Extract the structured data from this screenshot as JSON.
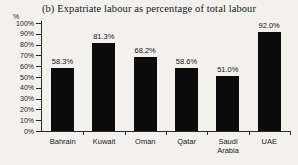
{
  "chart_data": {
    "type": "bar",
    "title": "(b) Expatriate labour as percentage of total labour",
    "xlabel": "",
    "ylabel": "%",
    "categories": [
      "Bahrain",
      "Kuwait",
      "Oman",
      "Qatar",
      "Saudi Arabia",
      "UAE"
    ],
    "values": [
      58.3,
      81.3,
      68.2,
      58.6,
      51.0,
      92.0
    ],
    "data_labels": [
      "58.3%",
      "81.3%",
      "68.2%",
      "58.6%",
      "51.0%",
      "92.0%"
    ],
    "ylim": [
      0,
      100
    ],
    "ytick_values": [
      100,
      90,
      80,
      70,
      60,
      50,
      40,
      30,
      20,
      10,
      0
    ],
    "ytick_labels": [
      "100%",
      "90%",
      "80%",
      "70%",
      "60%",
      "50%",
      "40%",
      "30%",
      "20%",
      "10%",
      "0%"
    ],
    "grid": false,
    "legend": false,
    "legend_position": "none",
    "bar_color": "#0b0b0b",
    "background_color": "#f2f1ee",
    "axis_color": "#2a2a2a"
  },
  "category_lines": {
    "Bahrain": [
      "Bahrain"
    ],
    "Kuwait": [
      "Kuwait"
    ],
    "Oman": [
      "Oman"
    ],
    "Qatar": [
      "Qatar"
    ],
    "Saudi Arabia": [
      "Saudi",
      "Arabia"
    ],
    "UAE": [
      "UAE"
    ]
  }
}
